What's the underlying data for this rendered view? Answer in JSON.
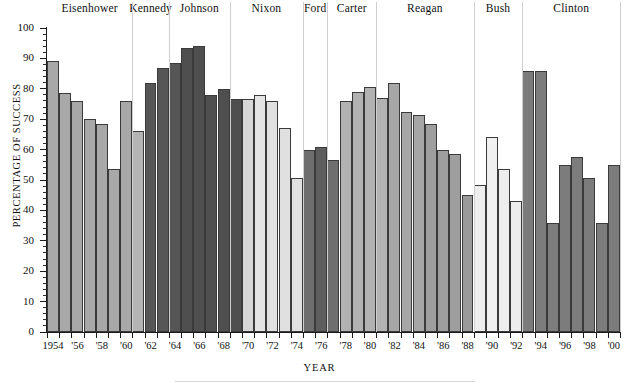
{
  "chart_data": {
    "type": "bar",
    "title": "",
    "xlabel": "YEAR",
    "ylabel": "PERCENTAGE OF SUCCESS",
    "ylim": [
      0,
      100
    ],
    "ytick_step": 10,
    "ytick_labels": [
      "100",
      "90",
      "80",
      "70",
      "60",
      "50",
      "40",
      "30",
      "20",
      "10",
      "0"
    ],
    "grid": false,
    "legend_position": "none",
    "xtick_labels": [
      "1954",
      "'56",
      "'58",
      "'60",
      "'62",
      "'64",
      "'66",
      "'68",
      "'70",
      "'72",
      "'74",
      "'76",
      "'78",
      "'80",
      "'82",
      "'84",
      "'86",
      "'88",
      "'90",
      "'92",
      "'94",
      "'96",
      "'98",
      "'00"
    ],
    "categories": [
      1954,
      1955,
      1956,
      1957,
      1958,
      1959,
      1960,
      1961,
      1962,
      1963,
      1964,
      1965,
      1966,
      1967,
      1968,
      1969,
      1970,
      1971,
      1972,
      1973,
      1974,
      1975,
      1976,
      1977,
      1978,
      1979,
      1980,
      1981,
      1982,
      1983,
      1984,
      1985,
      1986,
      1987,
      1988,
      1989,
      1990,
      1991,
      1992,
      1993,
      1994,
      1995,
      1996,
      1997,
      1998,
      1999,
      2000
    ],
    "values": [
      89,
      78.5,
      76,
      70,
      68.5,
      53.5,
      76,
      66,
      82,
      87,
      88.5,
      93.5,
      94,
      78,
      80,
      76.5,
      76.5,
      78,
      76,
      67,
      50.5,
      60,
      61,
      56.5,
      76,
      79,
      80.5,
      77,
      82,
      72.5,
      71.5,
      68.5,
      60,
      58.5,
      45,
      48.5,
      64,
      53.5,
      43,
      86,
      86,
      36,
      55,
      57.5,
      50.5,
      36,
      55
    ],
    "group_key": "presidency",
    "groups": [
      {
        "name": "Eisenhower",
        "start_year": 1954,
        "end_year": 1960,
        "color": "#a8a8a8"
      },
      {
        "name": "Kennedy",
        "start_year": 1961,
        "end_year": 1963,
        "color": "#565656"
      },
      {
        "name": "Johnson",
        "start_year": 1964,
        "end_year": 1968,
        "color": "#565656"
      },
      {
        "name": "Nixon",
        "start_year": 1969,
        "end_year": 1974,
        "color": "#e2e2e2"
      },
      {
        "name": "Ford",
        "start_year": 1975,
        "end_year": 1976,
        "color": "#6e6e6e"
      },
      {
        "name": "Carter",
        "start_year": 1977,
        "end_year": 1980,
        "color": "#b2b2b2"
      },
      {
        "name": "Reagan",
        "start_year": 1981,
        "end_year": 1988,
        "color": "#a2a2a2"
      },
      {
        "name": "Bush",
        "start_year": 1989,
        "end_year": 1992,
        "color": "#ededed"
      },
      {
        "name": "Clinton",
        "start_year": 1993,
        "end_year": 2000,
        "color": "#7c7c7c"
      }
    ],
    "bars": [
      {
        "year": 1954,
        "value": 89,
        "group": "Eisenhower",
        "color": "#a8a8a8"
      },
      {
        "year": 1955,
        "value": 78.5,
        "group": "Eisenhower",
        "color": "#a8a8a8"
      },
      {
        "year": 1956,
        "value": 76,
        "group": "Eisenhower",
        "color": "#a8a8a8"
      },
      {
        "year": 1957,
        "value": 70,
        "group": "Eisenhower",
        "color": "#a8a8a8"
      },
      {
        "year": 1958,
        "value": 68.5,
        "group": "Eisenhower",
        "color": "#a8a8a8"
      },
      {
        "year": 1959,
        "value": 53.5,
        "group": "Eisenhower",
        "color": "#a8a8a8"
      },
      {
        "year": 1960,
        "value": 76,
        "group": "Eisenhower",
        "color": "#a8a8a8"
      },
      {
        "year": 1961,
        "value": 66,
        "group": "Eisenhower",
        "color": "#b4b4b4"
      },
      {
        "year": 1962,
        "value": 82,
        "group": "Kennedy",
        "color": "#565656"
      },
      {
        "year": 1963,
        "value": 87,
        "group": "Kennedy",
        "color": "#565656"
      },
      {
        "year": 1964,
        "value": 88.5,
        "group": "Kennedy",
        "color": "#565656"
      },
      {
        "year": 1965,
        "value": 93.5,
        "group": "Johnson",
        "color": "#4f4f4f"
      },
      {
        "year": 1966,
        "value": 94,
        "group": "Johnson",
        "color": "#4f4f4f"
      },
      {
        "year": 1967,
        "value": 78,
        "group": "Johnson",
        "color": "#4f4f4f"
      },
      {
        "year": 1968,
        "value": 80,
        "group": "Johnson",
        "color": "#4f4f4f"
      },
      {
        "year": 1969,
        "value": 76.5,
        "group": "Johnson",
        "color": "#4f4f4f"
      },
      {
        "year": 1970,
        "value": 76.5,
        "group": "Nixon",
        "color": "#d6d6d6"
      },
      {
        "year": 1971,
        "value": 78,
        "group": "Nixon",
        "color": "#e4e4e4"
      },
      {
        "year": 1972,
        "value": 76,
        "group": "Nixon",
        "color": "#e0e0e0"
      },
      {
        "year": 1973,
        "value": 67,
        "group": "Nixon",
        "color": "#e0e0e0"
      },
      {
        "year": 1974,
        "value": 50.5,
        "group": "Nixon",
        "color": "#e0e0e0"
      },
      {
        "year": 1975,
        "value": 60,
        "group": "Ford",
        "color": "#6e6e6e"
      },
      {
        "year": 1976,
        "value": 61,
        "group": "Ford",
        "color": "#5e5e5e"
      },
      {
        "year": 1977,
        "value": 56.5,
        "group": "Ford",
        "color": "#6e6e6e"
      },
      {
        "year": 1978,
        "value": 76,
        "group": "Carter",
        "color": "#b2b2b2"
      },
      {
        "year": 1979,
        "value": 79,
        "group": "Carter",
        "color": "#b2b2b2"
      },
      {
        "year": 1980,
        "value": 80.5,
        "group": "Carter",
        "color": "#b2b2b2"
      },
      {
        "year": 1981,
        "value": 77,
        "group": "Carter",
        "color": "#b2b2b2"
      },
      {
        "year": 1982,
        "value": 82,
        "group": "Reagan",
        "color": "#a6a6a6"
      },
      {
        "year": 1983,
        "value": 72.5,
        "group": "Reagan",
        "color": "#a6a6a6"
      },
      {
        "year": 1984,
        "value": 71.5,
        "group": "Reagan",
        "color": "#a6a6a6"
      },
      {
        "year": 1985,
        "value": 68.5,
        "group": "Reagan",
        "color": "#9e9e9e"
      },
      {
        "year": 1986,
        "value": 60,
        "group": "Reagan",
        "color": "#9e9e9e"
      },
      {
        "year": 1987,
        "value": 58.5,
        "group": "Reagan",
        "color": "#9e9e9e"
      },
      {
        "year": 1988,
        "value": 45,
        "group": "Reagan",
        "color": "#9a9a9a"
      },
      {
        "year": 1989,
        "value": 48.5,
        "group": "Bush",
        "color": "#ededed"
      },
      {
        "year": 1990,
        "value": 64,
        "group": "Bush",
        "color": "#f0f0f0"
      },
      {
        "year": 1991,
        "value": 53.5,
        "group": "Bush",
        "color": "#ededed"
      },
      {
        "year": 1992,
        "value": 43,
        "group": "Bush",
        "color": "#ededed"
      },
      {
        "year": 1993,
        "value": 86,
        "group": "Clinton",
        "color": "#7c7c7c"
      },
      {
        "year": 1994,
        "value": 86,
        "group": "Clinton",
        "color": "#7c7c7c"
      },
      {
        "year": 1995,
        "value": 36,
        "group": "Clinton",
        "color": "#7c7c7c"
      },
      {
        "year": 1996,
        "value": 55,
        "group": "Clinton",
        "color": "#7c7c7c"
      },
      {
        "year": 1997,
        "value": 57.5,
        "group": "Clinton",
        "color": "#7c7c7c"
      },
      {
        "year": 1998,
        "value": 50.5,
        "group": "Clinton",
        "color": "#7c7c7c"
      },
      {
        "year": 1999,
        "value": 36,
        "group": "Clinton",
        "color": "#7c7c7c"
      },
      {
        "year": 2000,
        "value": 55,
        "group": "Clinton",
        "color": "#7c7c7c"
      }
    ]
  }
}
